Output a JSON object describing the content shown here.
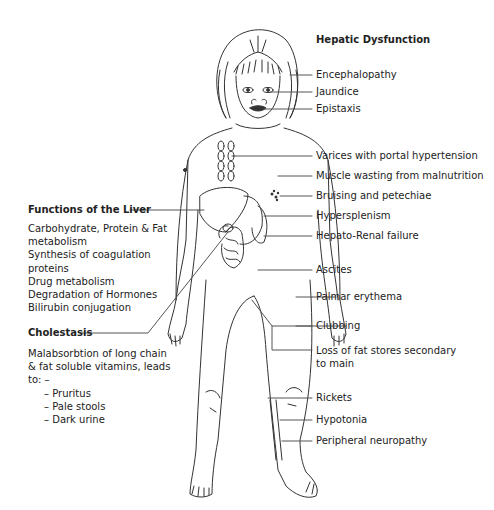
{
  "hepatic": {
    "title": "Hepatic Dysfunction",
    "items": [
      {
        "label": "Encephalopathy",
        "y": 75
      },
      {
        "label": "Jaundice",
        "y": 92
      },
      {
        "label": "Epistaxis",
        "y": 109
      },
      {
        "label": "Varices with portal hypertension",
        "y": 156
      },
      {
        "label": "Muscle wasting from malnutrition",
        "y": 176
      },
      {
        "label": "Bruising and petechiae",
        "y": 196
      },
      {
        "label": "Hypersplenism",
        "y": 216
      },
      {
        "label": "Hepato-Renal failure",
        "y": 236
      },
      {
        "label": "Ascites",
        "y": 270
      },
      {
        "label": "Palmar erythema",
        "y": 297
      },
      {
        "label": "Clubbing",
        "y": 326
      },
      {
        "label": "Loss of fat stores secondary",
        "y": 351
      },
      {
        "label": "to main",
        "y": 364
      },
      {
        "label": "Rickets",
        "y": 398
      },
      {
        "label": "Hypotonia",
        "y": 420
      },
      {
        "label": "Peripheral neuropathy",
        "y": 441
      }
    ]
  },
  "functions": {
    "title": "Functions of the Liver",
    "lines": [
      "Carbohydrate, Protein & Fat",
      "metabolism",
      "Synthesis of coagulation",
      "proteins",
      "Drug metabolism",
      "Degradation of Hormones",
      "Bilirubin conjugation"
    ]
  },
  "cholestasis": {
    "title": "Cholestasis",
    "lines": [
      "Malabsorbtion of long chain",
      "& fat soluble vitamins, leads",
      "to: –"
    ],
    "bullets": [
      "– Pruritus",
      "– Pale stools",
      "– Dark urine"
    ]
  }
}
